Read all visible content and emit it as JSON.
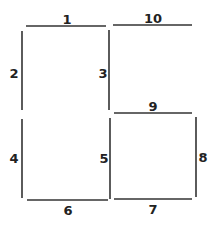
{
  "diagram": {
    "type": "line-segment-grid",
    "line_color": "#333333",
    "label_color": "#222222",
    "segments": [
      {
        "label": "1",
        "orientation": "horizontal",
        "x1": 26,
        "y1": 26,
        "x2": 106,
        "y2": 26,
        "lx": 67,
        "ly": 20
      },
      {
        "label": "2",
        "orientation": "vertical",
        "x1": 22,
        "y1": 31,
        "x2": 22,
        "y2": 110,
        "lx": 14,
        "ly": 74
      },
      {
        "label": "3",
        "orientation": "vertical",
        "x1": 109,
        "y1": 30,
        "x2": 109,
        "y2": 110,
        "lx": 103,
        "ly": 74
      },
      {
        "label": "4",
        "orientation": "vertical",
        "x1": 22,
        "y1": 119,
        "x2": 22,
        "y2": 198,
        "lx": 14,
        "ly": 159
      },
      {
        "label": "5",
        "orientation": "vertical",
        "x1": 110,
        "y1": 118,
        "x2": 110,
        "y2": 199,
        "lx": 104,
        "ly": 159
      },
      {
        "label": "6",
        "orientation": "horizontal",
        "x1": 27,
        "y1": 200,
        "x2": 108,
        "y2": 200,
        "lx": 68,
        "ly": 211
      },
      {
        "label": "7",
        "orientation": "horizontal",
        "x1": 114,
        "y1": 199,
        "x2": 192,
        "y2": 199,
        "lx": 153,
        "ly": 210
      },
      {
        "label": "8",
        "orientation": "vertical",
        "x1": 196,
        "y1": 117,
        "x2": 196,
        "y2": 197,
        "lx": 203,
        "ly": 158
      },
      {
        "label": "9",
        "orientation": "horizontal",
        "x1": 114,
        "y1": 113,
        "x2": 192,
        "y2": 113,
        "lx": 153,
        "ly": 107
      },
      {
        "label": "10",
        "orientation": "horizontal",
        "x1": 113,
        "y1": 25,
        "x2": 192,
        "y2": 25,
        "lx": 153,
        "ly": 19
      }
    ]
  }
}
